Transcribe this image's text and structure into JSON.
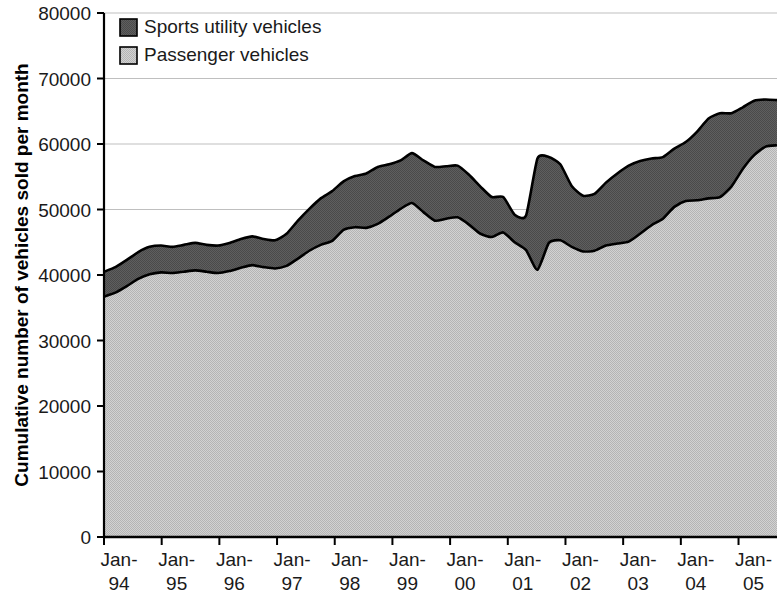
{
  "chart_data": {
    "type": "area",
    "stacked": true,
    "title": "",
    "subtitle": "",
    "xlabel": "",
    "ylabel": "Cumulative number of vehicles sold per month",
    "ylim": [
      0,
      80000
    ],
    "ytick_labels": [
      "80000",
      "70000",
      "60000",
      "50000",
      "40000",
      "30000",
      "20000",
      "10000",
      "0"
    ],
    "ytick_values": [
      80000,
      70000,
      60000,
      50000,
      40000,
      30000,
      20000,
      10000,
      0
    ],
    "xtick_labels": [
      "Jan-\n94",
      "Jan-\n95",
      "Jan-\n96",
      "Jan-\n97",
      "Jan-\n98",
      "Jan-\n99",
      "Jan-\n00",
      "Jan-\n01",
      "Jan-\n02",
      "Jan-\n03",
      "Jan-\n04",
      "Jan-\n05"
    ],
    "xtick_labels_line1": [
      "Jan-",
      "Jan-",
      "Jan-",
      "Jan-",
      "Jan-",
      "Jan-",
      "Jan-",
      "Jan-",
      "Jan-",
      "Jan-",
      "Jan-",
      "Jan-"
    ],
    "xtick_labels_line2": [
      "94",
      "95",
      "96",
      "97",
      "98",
      "99",
      "00",
      "01",
      "02",
      "03",
      "04",
      "05"
    ],
    "grid": true,
    "grid_axis": "y",
    "legend_position": "top-left",
    "legend": [
      "Sports utility vehicles",
      "Passenger vehicles"
    ],
    "colors": {
      "sports_utility_vehicles": "#5a5a5a",
      "passenger_vehicles": "#c5c5c5",
      "outline": "#000000",
      "gridline": "#bfbfbf",
      "axis": "#000000"
    },
    "x_start_year": 1994.0,
    "x_end_year": 2005.67,
    "x_step_years": 0.25,
    "series": [
      {
        "name": "Passenger vehicles",
        "color": "#c5c5c5",
        "values": [
          36700,
          37300,
          38300,
          39400,
          40100,
          40400,
          40300,
          40500,
          40700,
          40500,
          40300,
          40600,
          41100,
          41500,
          41200,
          41000,
          41400,
          42500,
          43700,
          44600,
          45200,
          46900,
          47300,
          47200,
          47800,
          48900,
          50100,
          51000,
          49600,
          48300,
          48600,
          48800,
          47700,
          46300,
          45800,
          46500,
          45000,
          43800,
          40800,
          44900,
          45300,
          44300,
          43600,
          43700,
          44500,
          44800,
          45100,
          46300,
          47600,
          48600,
          50400,
          51300,
          51400,
          51700,
          51900,
          53500,
          56200,
          58300,
          59600,
          59800
        ]
      },
      {
        "name": "Sports utility vehicles",
        "color": "#5a5a5a",
        "values": [
          3800,
          3900,
          4000,
          4100,
          4200,
          4100,
          4000,
          4100,
          4200,
          4100,
          4200,
          4300,
          4400,
          4400,
          4300,
          4300,
          4900,
          5800,
          6400,
          7100,
          7600,
          7400,
          7800,
          8300,
          8700,
          8000,
          7400,
          7600,
          7900,
          8200,
          8000,
          7900,
          7600,
          7200,
          6100,
          5400,
          4200,
          5300,
          17000,
          13100,
          11600,
          9300,
          8500,
          8700,
          9600,
          10700,
          11600,
          11100,
          10200,
          9400,
          8900,
          9000,
          10500,
          12200,
          12800,
          11200,
          9400,
          8300,
          7200,
          6900
        ]
      }
    ],
    "totals": [
      40500,
      41200,
      42300,
      43500,
      44300,
      44500,
      44300,
      44600,
      44900,
      44600,
      44500,
      44900,
      45500,
      45900,
      45500,
      45300,
      46300,
      48300,
      50100,
      51700,
      52800,
      54300,
      55100,
      55500,
      56500,
      56900,
      57500,
      58600,
      57500,
      56500,
      56600,
      56700,
      55300,
      53500,
      51900,
      51900,
      49200,
      49100,
      57800,
      58000,
      56900,
      53600,
      52100,
      52400,
      54100,
      55500,
      56700,
      57400,
      57800,
      58000,
      59300,
      60300,
      61900,
      63900,
      64700,
      64700,
      65600,
      66600,
      66800,
      66700
    ]
  },
  "legend": {
    "items": [
      {
        "label": "Sports utility vehicles",
        "swatch": "#5a5a5a"
      },
      {
        "label": "Passenger vehicles",
        "swatch": "#c5c5c5"
      }
    ]
  },
  "axes": {
    "y_title": "Cumulative number of vehicles sold per month"
  }
}
